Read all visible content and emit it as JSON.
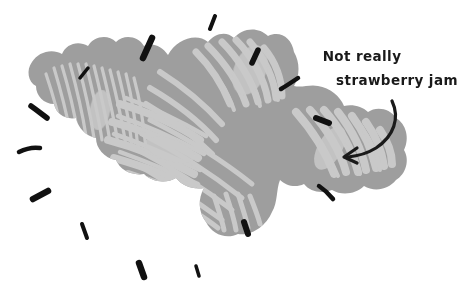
{
  "illustration": {
    "title": "Hand-drawn gray splat with handwritten annotation",
    "background_color": "#ffffff",
    "canvas": {
      "width": 464,
      "height": 293
    }
  },
  "annotation": {
    "line1": "Not really",
    "line2": "strawberry jam",
    "text_color": "#1a1a1a",
    "arrow_color": "#1a1a1a",
    "arrow_description": "curved arrow pointing down-left from text toward splat"
  },
  "splat": {
    "name": "jam-splat",
    "base_color": "#9e9e9e",
    "scribble_color": "#c9c9c9",
    "description": "irregular amoeba-shaped blob with lobes and interior hatching"
  },
  "splash_marks": {
    "color": "#111111",
    "count": 16,
    "description": "short black dashes radiating outward around the splat"
  }
}
